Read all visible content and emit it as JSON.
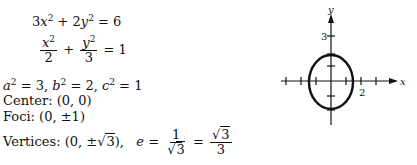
{
  "equations": {
    "standard": {
      "lhs_term1_coef": "3",
      "lhs_term1_var": "x",
      "plus": "+",
      "lhs_term2_coef": "2",
      "lhs_term2_var": "y",
      "equals": "= 6",
      "exp": "2"
    },
    "normalized": {
      "num1": "x",
      "den1": "2",
      "plus": "+",
      "num2": "y",
      "den2": "3",
      "rhs": "= 1",
      "exp": "2"
    }
  },
  "parameters": {
    "a_sq": "a",
    "a_val": " = 3, ",
    "b_sq": "b",
    "b_val": " = 2, ",
    "c_sq": "c",
    "c_val": " = 1",
    "exp": "2"
  },
  "center": {
    "label": "Center:",
    "value": "(0, 0)"
  },
  "foci": {
    "label": "Foci:",
    "value": "(0, ±1)"
  },
  "vertices": {
    "label": "Vertices:",
    "value_prefix": "(0, ±",
    "radicand": "3",
    "value_suffix": "),",
    "e_var": "e",
    "eq": "=",
    "frac1_num": "1",
    "frac1_den_radicand": "3",
    "frac2_num_radicand": "3",
    "frac2_den": "3"
  },
  "graph": {
    "x_axis_label": "x",
    "y_axis_label": "y",
    "x_tick_label": "2",
    "y_tick_label": "3",
    "ellipse": {
      "semi_major_y": "√3",
      "semi_minor_x": "√2",
      "center": [
        0,
        0
      ]
    }
  }
}
